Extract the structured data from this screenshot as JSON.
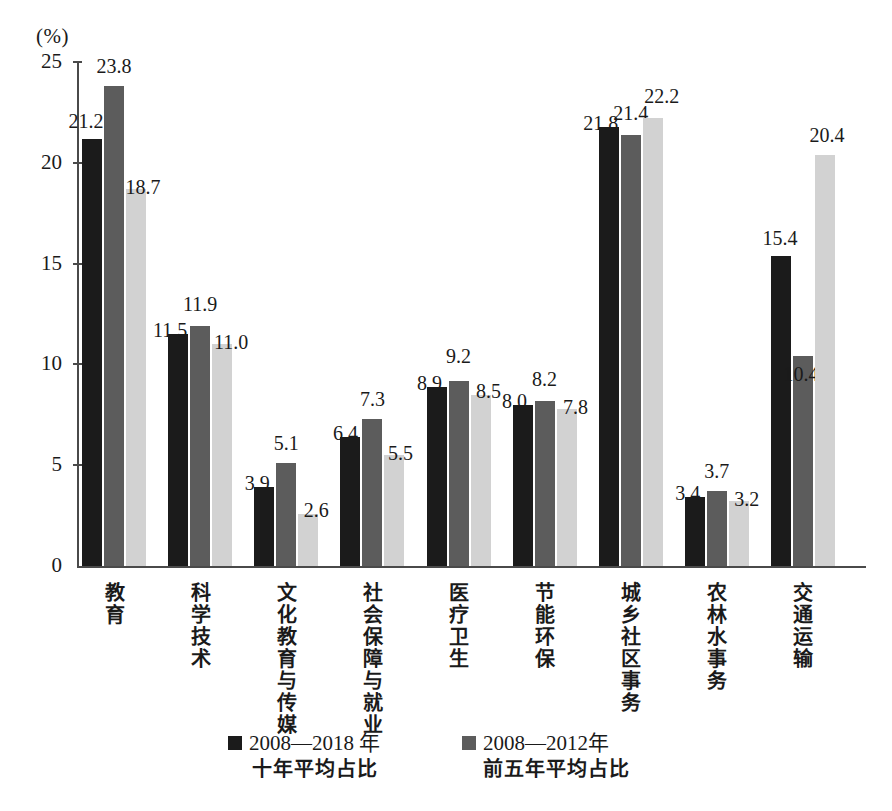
{
  "chart_data": {
    "type": "bar",
    "title": "",
    "subtitle": "",
    "xlabel": "",
    "ylabel": "",
    "unit_label": "(%)",
    "ylim": [
      0,
      25
    ],
    "yticks": [
      0,
      5,
      10,
      15,
      20,
      25
    ],
    "ytick_labels": [
      "0",
      "5",
      "10",
      "15",
      "20",
      "25"
    ],
    "grid": false,
    "legend_position": "bottom",
    "categories": [
      "教育",
      "科学技术",
      "文化教育与传媒",
      "社会保障与就业",
      "医疗卫生",
      "节能环保",
      "城乡社区事务",
      "农林水事务",
      "交通运输"
    ],
    "series": [
      {
        "name": "2008—2018 年十年平均占比",
        "color": "#1b1b1b",
        "values": [
          21.2,
          11.5,
          3.9,
          6.4,
          8.9,
          8.0,
          21.8,
          3.4,
          15.4
        ],
        "labels": [
          "21.2",
          "11.5",
          "3.9",
          "6.4",
          "8.9",
          "8.0",
          "21.8",
          "3.4",
          "15.4"
        ]
      },
      {
        "name": "2008—2012年前五年平均占比",
        "color": "#5c5c5c",
        "values": [
          23.8,
          11.9,
          5.1,
          7.3,
          9.2,
          8.2,
          21.4,
          3.7,
          10.4
        ],
        "labels": [
          "23.8",
          "11.9",
          "5.1",
          "7.3",
          "9.2",
          "8.2",
          "21.4",
          "3.7",
          "10.4"
        ]
      },
      {
        "name": "",
        "color": "#d2d2d2",
        "values": [
          18.7,
          11.0,
          2.6,
          5.5,
          8.5,
          7.8,
          22.2,
          3.2,
          20.4
        ],
        "labels": [
          "18.7",
          "11.0",
          "2.6",
          "5.5",
          "8.5",
          "7.8",
          "22.2",
          "3.2",
          "20.4"
        ]
      }
    ]
  },
  "legend": {
    "items": [
      {
        "swatch": "s0",
        "line1": "2008—2018 年",
        "line2": "十年平均占比"
      },
      {
        "swatch": "s1",
        "line1": "2008—2012年",
        "line2": "前五年平均占比"
      }
    ]
  },
  "colors": {
    "series_black": "#1b1b1b",
    "series_dark_gray": "#5c5c5c",
    "series_light_gray": "#d2d2d2",
    "axis": "#4a4a4a",
    "text": "#1a1a1a",
    "background": "#ffffff"
  }
}
